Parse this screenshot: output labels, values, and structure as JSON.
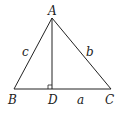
{
  "diagram": {
    "points": {
      "A": {
        "label": "A",
        "x": 52,
        "y": 18
      },
      "B": {
        "label": "B",
        "x": 14,
        "y": 89
      },
      "C": {
        "label": "C",
        "x": 111,
        "y": 89
      },
      "D": {
        "label": "D",
        "x": 52,
        "y": 89
      }
    },
    "sides": {
      "c": {
        "label": "c",
        "from": "A",
        "to": "B"
      },
      "b": {
        "label": "b",
        "from": "A",
        "to": "C"
      },
      "a": {
        "label": "a",
        "from": "B",
        "to": "C"
      }
    },
    "altitude": {
      "from": "A",
      "to": "D",
      "right_angle_marker": true
    },
    "colors": {
      "stroke": "#222222",
      "background": "#ffffff"
    }
  }
}
